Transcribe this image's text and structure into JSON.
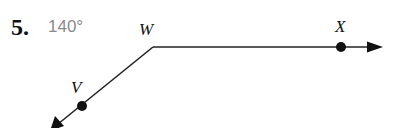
{
  "problem": {
    "number": "5.",
    "answer": "140°"
  },
  "diagram": {
    "vertex": {
      "label": "W",
      "x": 153,
      "y": 47
    },
    "points": [
      {
        "label": "X",
        "x": 341,
        "y": 47
      },
      {
        "label": "V",
        "x": 82,
        "y": 106
      }
    ],
    "rays": [
      {
        "from": "W",
        "through": "X",
        "direction": "right"
      },
      {
        "from": "W",
        "through": "V",
        "direction": "down-left"
      }
    ],
    "angle_measure": "140°",
    "line_color": "#222222",
    "answer_color": "#8a8a8a"
  }
}
